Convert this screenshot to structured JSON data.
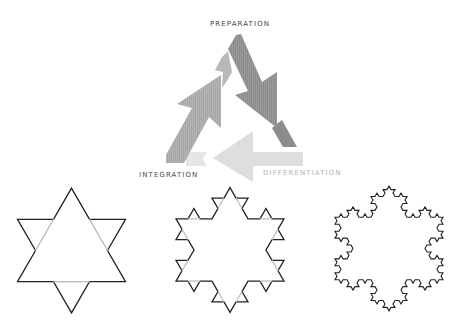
{
  "cycle": {
    "labels": {
      "preparation": "PREPARATION",
      "integration": "INTEGRATION",
      "differentiation": "DIFFERENTIATION"
    },
    "arrows": [
      {
        "name": "preparation-to-differentiation",
        "color": "#8c8c8c",
        "direction": "down-right"
      },
      {
        "name": "differentiation-to-integration",
        "color": "#dcdcdc",
        "direction": "left"
      },
      {
        "name": "integration-to-preparation",
        "color": "#a8a8a8",
        "direction": "up-right"
      }
    ]
  },
  "snowflakes": [
    {
      "name": "koch-iteration-1",
      "iteration": 1,
      "cx": 71.5,
      "cy": 250.5,
      "side": 108,
      "stroke": "#222222",
      "guide": "#bdbdbd"
    },
    {
      "name": "koch-iteration-2",
      "iteration": 2,
      "cx": 230,
      "cy": 250,
      "side": 108,
      "stroke": "#222222",
      "guide": "#c4c4c4"
    },
    {
      "name": "koch-iteration-3",
      "iteration": 3,
      "cx": 389,
      "cy": 248.5,
      "side": 108,
      "stroke": "#222222",
      "guide": null
    }
  ]
}
